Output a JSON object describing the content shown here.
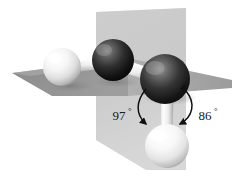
{
  "figure": {
    "type": "molecular-ball-and-stick-diagram",
    "title": "",
    "background_color": "#ffffff",
    "molecule": "H2O2 hydrogen peroxide dihedral geometry"
  },
  "planes": {
    "horizontal": {
      "name": "horizontal-reference-plane",
      "fill_left": "#8e8e8e",
      "fill_right": "#a8a8a8",
      "description": "flat wedge-shaped plane seen edge-on"
    },
    "vertical": {
      "name": "vertical-reference-plane",
      "fill": "#c9c9c9",
      "fill_lower": "#d4d4d4",
      "description": "upright parallelogram plane behind atoms"
    }
  },
  "atoms": [
    {
      "id": "h-left",
      "element": "H",
      "type": "light",
      "cx": 62,
      "cy": 67,
      "r": 19,
      "color_light": "#ffffff",
      "color_mid": "#e2e2e2",
      "color_dark": "#9a9a9a"
    },
    {
      "id": "o-left",
      "element": "O",
      "type": "dark",
      "cx": 113,
      "cy": 60,
      "r": 21,
      "color_light": "#6d6d6d",
      "color_mid": "#303030",
      "color_dark": "#0d0d0d"
    },
    {
      "id": "o-right",
      "element": "O",
      "type": "dark",
      "cx": 165,
      "cy": 79,
      "r": 25,
      "color_light": "#787878",
      "color_mid": "#343434",
      "color_dark": "#0d0d0d"
    },
    {
      "id": "h-bottom",
      "element": "H",
      "type": "light",
      "cx": 167,
      "cy": 146,
      "r": 22,
      "color_light": "#ffffff",
      "color_mid": "#e6e6e6",
      "color_dark": "#a0a0a0"
    }
  ],
  "bonds": [
    {
      "id": "bond-h-left-o-left",
      "from": "h-left",
      "to": "o-left",
      "color": "#f2f2f2",
      "shade": "#9e9e9e"
    },
    {
      "id": "bond-o-left-o-right",
      "from": "o-left",
      "to": "o-right",
      "color": "#f2f2f2",
      "shade": "#9e9e9e"
    },
    {
      "id": "bond-o-right-h-bottom",
      "from": "o-right",
      "to": "h-bottom",
      "color": "#f4f4f4",
      "shade": "#a2a2a2"
    }
  ],
  "annotations": [
    {
      "id": "angle-97",
      "value": "97",
      "degree_symbol": "°",
      "label_x": 119,
      "label_y": 118,
      "arc_color": "#111111",
      "arrow_ends": "single",
      "description": "arc from upper O-O bond region curving down to the O-H bond, arrowhead at bottom"
    },
    {
      "id": "angle-86",
      "value": "86",
      "degree_symbol": "°",
      "label_x": 203,
      "label_y": 118,
      "arc_color": "#111111",
      "arrow_ends": "double",
      "description": "arc between horizontal plane edge and the downward O-H bond, arrowheads both ends"
    }
  ],
  "colors": {
    "ink": "#111111",
    "plane_dark": "#8e8e8e",
    "plane_mid": "#a8a8a8",
    "plane_light": "#c9c9c9",
    "background": "#ffffff"
  }
}
